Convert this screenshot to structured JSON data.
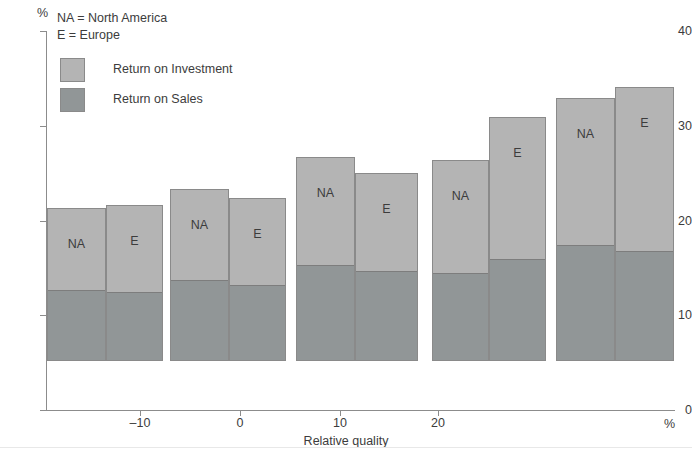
{
  "chart_data": {
    "type": "bar",
    "title": "",
    "subtitle": "",
    "xlabel": "Relative quality",
    "ylabel": "",
    "x_unit": "%",
    "y_unit": "%",
    "ylim": [
      0,
      40
    ],
    "y_ticks": [
      0,
      10,
      20,
      30,
      40
    ],
    "x_ticks": [
      -10,
      0,
      10,
      20
    ],
    "grid": false,
    "stacked": true,
    "legend_position": "top-left",
    "notes": [
      "NA = North America",
      "E = Europe"
    ],
    "series": [
      {
        "name": "Return on Investment",
        "color": "#b4b4b4"
      },
      {
        "name": "Return on Sales",
        "color": "#919697"
      }
    ],
    "groups": [
      {
        "bars": [
          {
            "label": "NA",
            "total": 16.2,
            "return_on_sales": 7.4,
            "return_on_investment": 8.8
          },
          {
            "label": "E",
            "total": 16.5,
            "return_on_sales": 7.2,
            "return_on_investment": 9.3
          }
        ]
      },
      {
        "bars": [
          {
            "label": "NA",
            "total": 18.2,
            "return_on_sales": 8.4,
            "return_on_investment": 9.8
          },
          {
            "label": "E",
            "total": 17.2,
            "return_on_sales": 7.9,
            "return_on_investment": 9.3
          }
        ]
      },
      {
        "bars": [
          {
            "label": "NA",
            "total": 21.5,
            "return_on_sales": 10.0,
            "return_on_investment": 11.5
          },
          {
            "label": "E",
            "total": 19.8,
            "return_on_sales": 9.4,
            "return_on_investment": 10.4
          }
        ]
      },
      {
        "bars": [
          {
            "label": "NA",
            "total": 21.2,
            "return_on_sales": 9.2,
            "return_on_investment": 12.0
          },
          {
            "label": "E",
            "total": 25.8,
            "return_on_sales": 10.7,
            "return_on_investment": 15.1
          }
        ]
      },
      {
        "bars": [
          {
            "label": "NA",
            "total": 27.8,
            "return_on_sales": 12.1,
            "return_on_investment": 15.7
          },
          {
            "label": "E",
            "total": 28.9,
            "return_on_sales": 11.5,
            "return_on_investment": 17.4
          }
        ]
      }
    ]
  },
  "legend": {
    "items": [
      {
        "label": "Return on Investment"
      },
      {
        "label": "Return on Sales"
      }
    ]
  }
}
